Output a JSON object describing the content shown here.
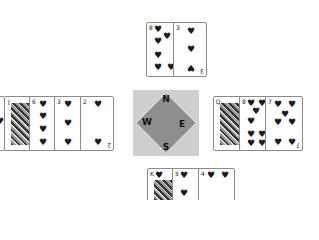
{
  "table": {
    "background": "#ffffff",
    "compass": {
      "north": "N",
      "east": "E",
      "south": "S",
      "west": "W",
      "box_color": "#cfcfcf",
      "diamond_color": "#8e8e8e"
    }
  },
  "hands": {
    "north": [
      {
        "rank": "8",
        "suit": "♥",
        "suit_name": "hearts"
      },
      {
        "rank": "3",
        "suit": "♥",
        "suit_name": "hearts"
      }
    ],
    "west": [
      {
        "rank": "",
        "suit": "♥",
        "suit_name": "hearts",
        "partial": true
      },
      {
        "rank": "J",
        "suit": "♠",
        "suit_name": "spades",
        "face": true
      },
      {
        "rank": "6",
        "suit": "♥",
        "suit_name": "hearts"
      },
      {
        "rank": "3",
        "suit": "♥",
        "suit_name": "hearts"
      },
      {
        "rank": "2",
        "suit": "♥",
        "suit_name": "hearts"
      }
    ],
    "east": [
      {
        "rank": "Q",
        "suit": "♠",
        "suit_name": "spades",
        "face": true
      },
      {
        "rank": "8",
        "suit": "♥",
        "suit_name": "hearts"
      },
      {
        "rank": "7",
        "suit": "♥",
        "suit_name": "hearts"
      }
    ],
    "south": [
      {
        "rank": "K",
        "suit": "♥",
        "suit_name": "hearts",
        "face": true
      },
      {
        "rank": "5",
        "suit": "♥",
        "suit_name": "hearts"
      },
      {
        "rank": "4",
        "suit": "♥",
        "suit_name": "hearts"
      }
    ]
  }
}
